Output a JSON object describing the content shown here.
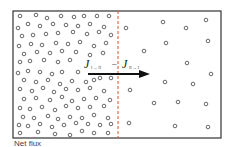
{
  "diagram": {
    "regions": [
      {
        "id": "I",
        "label": "Compartment I",
        "density": "high"
      },
      {
        "id": "II",
        "label": "Compartment II",
        "density": "low"
      }
    ],
    "flux_label": {
      "j1_main": "J",
      "j1_sub": "I → II",
      "minus": "–",
      "j2_main": "J",
      "j2_sub": "II → I"
    },
    "arrow_direction": "I to II",
    "caption": "Net flux"
  },
  "colors": {
    "border": "#333333",
    "membrane": "#d9603a",
    "particle": "#444444",
    "arrow": "#111111"
  }
}
